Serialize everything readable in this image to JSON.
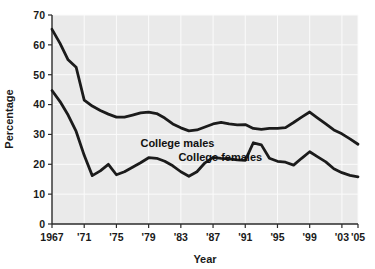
{
  "chart_data": {
    "type": "line",
    "title": "",
    "xlabel": "Year",
    "ylabel": "Percentage",
    "xlim": [
      1967,
      2005
    ],
    "ylim": [
      0,
      70
    ],
    "grid": true,
    "legend_position": "inline-annotation",
    "y_ticks": [
      0,
      10,
      20,
      30,
      40,
      50,
      60,
      70
    ],
    "y_tick_labels": [
      "0",
      "10",
      "20",
      "30",
      "40",
      "50",
      "60",
      "70"
    ],
    "x_ticks": [
      1967,
      1971,
      1975,
      1979,
      1983,
      1987,
      1991,
      1995,
      1999,
      2003,
      2005
    ],
    "x_tick_labels": [
      "1967",
      "'71",
      "'75",
      "'79",
      "'83",
      "'87",
      "'91",
      "'95",
      "'99",
      "'03",
      "'05"
    ],
    "x": [
      1967,
      1968,
      1969,
      1970,
      1971,
      1972,
      1973,
      1974,
      1975,
      1976,
      1977,
      1978,
      1979,
      1980,
      1981,
      1982,
      1983,
      1984,
      1985,
      1986,
      1987,
      1988,
      1989,
      1990,
      1991,
      1992,
      1993,
      1994,
      1995,
      1996,
      1997,
      1998,
      1999,
      2000,
      2001,
      2002,
      2003,
      2004,
      2005
    ],
    "series": [
      {
        "name": "College males",
        "label": "College males",
        "color": "#1b1b1b",
        "values": [
          65.2,
          60.5,
          55.0,
          52.5,
          41.5,
          39.5,
          38.0,
          36.8,
          35.8,
          35.8,
          36.5,
          37.2,
          37.5,
          37.0,
          35.5,
          33.5,
          32.2,
          31.2,
          31.5,
          32.5,
          33.5,
          34.0,
          33.5,
          33.2,
          33.3,
          32.0,
          31.7,
          32.0,
          32.0,
          32.3,
          34.0,
          35.8,
          37.5,
          35.5,
          33.5,
          31.5,
          30.2,
          28.5,
          26.7
        ]
      },
      {
        "name": "College females",
        "label": "College females",
        "color": "#1b1b1b",
        "values": [
          44.7,
          41.0,
          36.5,
          31.0,
          23.0,
          16.2,
          17.8,
          20.0,
          16.5,
          17.5,
          19.0,
          20.5,
          22.2,
          22.0,
          21.0,
          19.5,
          17.5,
          16.0,
          17.5,
          20.5,
          22.3,
          22.0,
          21.8,
          21.5,
          21.3,
          27.2,
          26.5,
          22.0,
          21.0,
          20.7,
          19.7,
          22.0,
          24.2,
          22.5,
          20.8,
          18.5,
          17.2,
          16.3,
          15.8
        ]
      }
    ],
    "annotations": [
      {
        "text": "College males",
        "x_pct": 41.0,
        "y_pct": 37.0
      },
      {
        "text": "College females",
        "x_pct": 55.0,
        "y_pct": 30.0
      }
    ]
  }
}
